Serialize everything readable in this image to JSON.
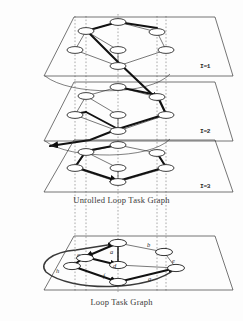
{
  "figure": {
    "captions": {
      "unrolled": "Unrolled Loop Task Graph",
      "loop": "Loop Task Graph"
    },
    "colors": {
      "ink": "#1a1a1a",
      "plane_outline": "#2b2b2b",
      "thin_edge": "#1f1f1f",
      "bold_edge": "#111111",
      "dotted_guide": "#555555",
      "node_fill": "#ffffff",
      "background": "#fdfdfd"
    },
    "planes": [
      {
        "id": "plane-1",
        "label": "I=1",
        "label_x": 200,
        "label_y": 68,
        "outline": "44,76 74,17 215,17 233,76",
        "nodes": [
          {
            "name": "a",
            "cx": 118,
            "cy": 22
          },
          {
            "name": "b",
            "cx": 157,
            "cy": 32
          },
          {
            "name": "c",
            "cx": 86,
            "cy": 31
          },
          {
            "name": "d",
            "cx": 118,
            "cy": 50
          },
          {
            "name": "e",
            "cx": 166,
            "cy": 50
          },
          {
            "name": "f",
            "cx": 75,
            "cy": 50
          },
          {
            "name": "g",
            "cx": 118,
            "cy": 66
          }
        ]
      },
      {
        "id": "plane-2",
        "label": "I=2",
        "label_x": 200,
        "label_y": 133,
        "outline": "44,141 74,82 215,82 233,141",
        "nodes": [
          {
            "name": "a",
            "cx": 118,
            "cy": 87
          },
          {
            "name": "b",
            "cx": 157,
            "cy": 97
          },
          {
            "name": "c",
            "cx": 86,
            "cy": 96
          },
          {
            "name": "d",
            "cx": 118,
            "cy": 115
          },
          {
            "name": "e",
            "cx": 166,
            "cy": 115
          },
          {
            "name": "f",
            "cx": 75,
            "cy": 115
          },
          {
            "name": "g",
            "cx": 118,
            "cy": 131
          }
        ]
      },
      {
        "id": "plane-3",
        "label": "I=3",
        "label_x": 200,
        "label_y": 188,
        "outline": "44,192 74,140 215,140 233,192",
        "nodes": [
          {
            "name": "a",
            "cx": 118,
            "cy": 145
          },
          {
            "name": "b",
            "cx": 157,
            "cy": 153
          },
          {
            "name": "c",
            "cx": 86,
            "cy": 152
          },
          {
            "name": "d",
            "cx": 118,
            "cy": 168
          },
          {
            "name": "e",
            "cx": 166,
            "cy": 168
          },
          {
            "name": "f",
            "cx": 75,
            "cy": 168
          },
          {
            "name": "g",
            "cx": 118,
            "cy": 182
          }
        ]
      },
      {
        "id": "plane-loop",
        "label": "",
        "label_x": 0,
        "label_y": 0,
        "outline": "44,290 74,236 215,236 233,290",
        "nodes": [
          {
            "name": "a",
            "cx": 118,
            "cy": 243
          },
          {
            "name": "b",
            "cx": 164,
            "cy": 252
          },
          {
            "name": "c",
            "cx": 85,
            "cy": 258
          },
          {
            "name": "d",
            "cx": 118,
            "cy": 265
          },
          {
            "name": "e",
            "cx": 176,
            "cy": 268
          },
          {
            "name": "f",
            "cx": 72,
            "cy": 266
          },
          {
            "name": "g",
            "cx": 118,
            "cy": 282
          }
        ]
      }
    ],
    "loop_graph_labels": [
      {
        "text": "a",
        "x": 110,
        "y": 254
      },
      {
        "text": "b",
        "x": 147,
        "y": 247
      },
      {
        "text": "c",
        "x": 77,
        "y": 257
      },
      {
        "text": "d",
        "x": 113,
        "y": 268
      },
      {
        "text": "e",
        "x": 172,
        "y": 263
      },
      {
        "text": "f",
        "x": 103,
        "y": 278
      },
      {
        "text": "g",
        "x": 148,
        "y": 281
      },
      {
        "text": "h",
        "x": 56,
        "y": 273
      }
    ],
    "guide_lines_x": [
      75,
      86,
      118,
      157,
      166
    ],
    "legend_notes": {
      "thin_edges": "intra-iteration dependence",
      "bold_edges": "inter-iteration (loop-carried) dependence"
    }
  }
}
